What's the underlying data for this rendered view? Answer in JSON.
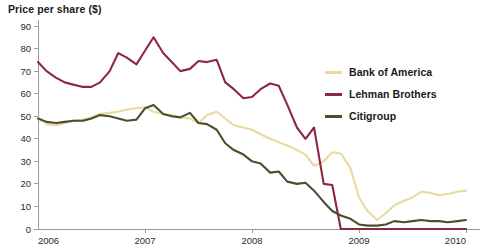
{
  "chart_data": {
    "type": "line",
    "title": "Price per share ($)",
    "xlabel": "",
    "ylabel": "Price per share ($)",
    "ylim": [
      0,
      90
    ],
    "xlim": [
      2006,
      2010
    ],
    "grid": false,
    "legend_position": "right",
    "y_ticks": [
      0,
      10,
      20,
      30,
      40,
      50,
      60,
      70,
      80,
      90
    ],
    "y_tick_labels": [
      "0",
      "10",
      "20",
      "30",
      "40",
      "50",
      "60",
      "70",
      "80",
      "90"
    ],
    "x_ticks": [
      2006,
      2007,
      2008,
      2009,
      2010
    ],
    "x_tick_labels": [
      "2006",
      "2007",
      "2008",
      "2009",
      "2010"
    ],
    "series": [
      {
        "name": "Bank of America",
        "color": "#e8dba0",
        "x": [
          2006.0,
          2006.08,
          2006.17,
          2006.25,
          2006.33,
          2006.42,
          2006.5,
          2006.58,
          2006.67,
          2006.75,
          2006.83,
          2006.92,
          2007.0,
          2007.08,
          2007.17,
          2007.25,
          2007.33,
          2007.42,
          2007.5,
          2007.58,
          2007.67,
          2007.75,
          2007.83,
          2007.92,
          2008.0,
          2008.08,
          2008.17,
          2008.25,
          2008.33,
          2008.42,
          2008.5,
          2008.58,
          2008.67,
          2008.75,
          2008.83,
          2008.92,
          2009.0,
          2009.08,
          2009.17,
          2009.25,
          2009.33,
          2009.42,
          2009.5,
          2009.58,
          2009.67,
          2009.75,
          2009.83,
          2009.92,
          2010.0
        ],
        "values": [
          49.5,
          46.5,
          46.0,
          47.0,
          48.0,
          48.5,
          49.5,
          51.0,
          51.5,
          52.0,
          53.0,
          53.5,
          54.0,
          52.0,
          51.0,
          50.5,
          49.5,
          49.0,
          47.0,
          50.5,
          52.0,
          49.0,
          46.0,
          45.0,
          44.0,
          42.0,
          40.0,
          38.5,
          37.0,
          35.0,
          33.0,
          28.0,
          30.0,
          34.0,
          33.5,
          27.0,
          14.0,
          8.0,
          4.0,
          7.0,
          10.5,
          12.5,
          14.0,
          16.5,
          16.0,
          15.0,
          15.5,
          16.5,
          17.0
        ],
        "start_value": 49.5,
        "peak_value": 54.0,
        "end_value": 17.0,
        "min_value": 4.0
      },
      {
        "name": "Lehman Brothers",
        "color": "#8b2842",
        "x": [
          2006.0,
          2006.08,
          2006.17,
          2006.25,
          2006.33,
          2006.42,
          2006.5,
          2006.58,
          2006.67,
          2006.75,
          2006.83,
          2006.92,
          2007.0,
          2007.08,
          2007.17,
          2007.25,
          2007.33,
          2007.42,
          2007.5,
          2007.58,
          2007.67,
          2007.75,
          2007.83,
          2007.92,
          2008.0,
          2008.08,
          2008.17,
          2008.25,
          2008.33,
          2008.42,
          2008.5,
          2008.58,
          2008.67,
          2008.75,
          2008.83,
          2008.92,
          2009.0,
          2009.25,
          2009.5,
          2009.75,
          2010.0
        ],
        "values": [
          74.0,
          70.0,
          67.0,
          65.0,
          64.0,
          63.0,
          63.0,
          65.0,
          70.0,
          78.0,
          76.0,
          73.0,
          79.0,
          85.0,
          78.0,
          74.0,
          70.0,
          71.0,
          74.5,
          74.0,
          75.0,
          65.0,
          62.0,
          58.0,
          58.5,
          62.0,
          64.5,
          63.5,
          55.0,
          45.0,
          40.0,
          45.0,
          20.0,
          19.5,
          0.0,
          0.0,
          0.0,
          0.0,
          0.0,
          0.0,
          0.0
        ],
        "start_value": 74.0,
        "peak_value": 85.0,
        "end_value": 0.0,
        "collapse_year": 2008.83
      },
      {
        "name": "Citigroup",
        "color": "#4a4f2c",
        "x": [
          2006.0,
          2006.08,
          2006.17,
          2006.25,
          2006.33,
          2006.42,
          2006.5,
          2006.58,
          2006.67,
          2006.75,
          2006.83,
          2006.92,
          2007.0,
          2007.08,
          2007.17,
          2007.25,
          2007.33,
          2007.42,
          2007.5,
          2007.58,
          2007.67,
          2007.75,
          2007.83,
          2007.92,
          2008.0,
          2008.08,
          2008.17,
          2008.25,
          2008.33,
          2008.42,
          2008.5,
          2008.58,
          2008.67,
          2008.75,
          2008.83,
          2008.92,
          2009.0,
          2009.08,
          2009.17,
          2009.25,
          2009.33,
          2009.42,
          2009.5,
          2009.58,
          2009.67,
          2009.75,
          2009.83,
          2009.92,
          2010.0
        ],
        "values": [
          49.0,
          47.5,
          47.0,
          47.5,
          48.0,
          48.0,
          49.0,
          50.5,
          50.0,
          49.0,
          48.0,
          48.5,
          53.5,
          55.0,
          51.0,
          50.0,
          49.5,
          51.5,
          47.0,
          46.5,
          44.0,
          38.0,
          35.0,
          33.0,
          30.0,
          29.0,
          25.0,
          25.5,
          21.0,
          20.0,
          20.5,
          17.0,
          12.0,
          8.0,
          6.0,
          4.5,
          2.0,
          1.5,
          1.5,
          2.0,
          3.5,
          3.0,
          3.5,
          4.0,
          3.5,
          3.5,
          3.0,
          3.5,
          4.0
        ],
        "start_value": 49.0,
        "peak_value": 55.0,
        "end_value": 4.0,
        "min_value": 1.5
      }
    ]
  },
  "legend": {
    "items": [
      {
        "label": "Bank of America",
        "color": "#e8dba0"
      },
      {
        "label": "Lehman Brothers",
        "color": "#8b2842"
      },
      {
        "label": "Citigroup",
        "color": "#4a4f2c"
      }
    ]
  }
}
